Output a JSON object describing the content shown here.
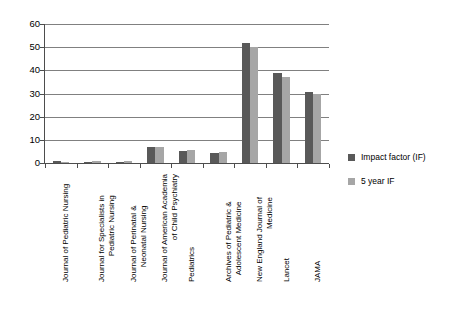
{
  "chart_data": {
    "type": "bar",
    "title": "",
    "subtitle": "",
    "xlabel": "",
    "ylabel": "",
    "ylim": [
      0,
      60
    ],
    "y_ticks": [
      0,
      10,
      20,
      30,
      40,
      50,
      60
    ],
    "grid": "horizontal",
    "legend_position": "right",
    "categories": [
      "Journal of Pediatric Nursing",
      "Journal for Specialists in Pediatric Nursing",
      "Journal of Perinatal & Neonatal Nursing",
      "Journal of American Academia of Child Psychiatry",
      "Pediatrics",
      "Archives of Pediatric & Adolescent Medicine",
      "New England Journal of Medicine",
      "Lancet",
      "JAMA"
    ],
    "category_lines": [
      [
        "Journal of Pediatric Nursing"
      ],
      [
        "Journal for Specialists in",
        "Pediatric Nursing"
      ],
      [
        "Journal of Perinatal &",
        "Neonatal Nursing"
      ],
      [
        "Journal of American Academia",
        "of Child Psychiatry"
      ],
      [
        "Pediatrics"
      ],
      [
        "Archives of Pediatric &",
        "Adolescent Medicine"
      ],
      [
        "New England Journal of",
        "Medicine"
      ],
      [
        "Lancet"
      ],
      [
        "JAMA"
      ]
    ],
    "series": [
      {
        "name": "Impact factor (IF)",
        "color": "#595959",
        "values": [
          0.8,
          0.5,
          0.6,
          7.0,
          5.1,
          4.3,
          52.0,
          39.0,
          30.5
        ]
      },
      {
        "name": "5 year IF",
        "color": "#a6a6a6",
        "values": [
          0.6,
          0.9,
          0.9,
          7.0,
          5.6,
          4.8,
          50.0,
          37.2,
          29.8
        ]
      }
    ]
  },
  "legend": {
    "items": [
      {
        "label": "Impact factor (IF)",
        "color": "#595959"
      },
      {
        "label": "5 year IF",
        "color": "#a6a6a6"
      }
    ]
  },
  "axis": {
    "y_tick_labels": [
      "60",
      "50",
      "40",
      "30",
      "20",
      "10",
      "0"
    ]
  }
}
